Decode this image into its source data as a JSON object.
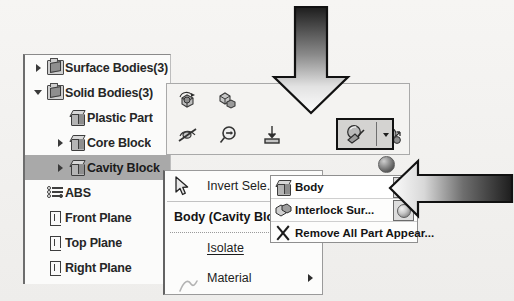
{
  "app": {
    "context": "SolidWorks feature tree with appearance context menu"
  },
  "tree": {
    "name": "feature-manager-tree",
    "items": [
      {
        "label": "Surface Bodies(3)",
        "icon": "folder-surface-icon",
        "expander": "collapsed",
        "indent": 0,
        "selected": false
      },
      {
        "label": "Solid Bodies(3)",
        "icon": "folder-solid-icon",
        "expander": "expanded",
        "indent": 0,
        "selected": false
      },
      {
        "label": "Plastic Part",
        "icon": "solid-body-icon",
        "expander": "none",
        "indent": 1,
        "selected": false
      },
      {
        "label": "Core Block",
        "icon": "solid-body-icon",
        "expander": "collapsed",
        "indent": 1,
        "selected": false
      },
      {
        "label": "Cavity Block",
        "icon": "solid-body-icon",
        "expander": "collapsed",
        "indent": 1,
        "selected": true
      },
      {
        "label": "ABS",
        "icon": "material-icon",
        "expander": "none",
        "indent": 0,
        "selected": false
      },
      {
        "label": "Front Plane",
        "icon": "plane-icon",
        "expander": "none",
        "indent": 0,
        "selected": false
      },
      {
        "label": "Top Plane",
        "icon": "plane-icon",
        "expander": "none",
        "indent": 0,
        "selected": false
      },
      {
        "label": "Right Plane",
        "icon": "plane-icon",
        "expander": "none",
        "indent": 0,
        "selected": false
      }
    ]
  },
  "context_toolbar": {
    "name": "context-toolbar",
    "row1": [
      {
        "icon": "rotate-body-icon",
        "tooltip": ""
      },
      {
        "icon": "move-copy-body-icon",
        "tooltip": ""
      }
    ],
    "row2": [
      {
        "icon": "hide-body-icon",
        "tooltip": ""
      },
      {
        "icon": "zoom-to-selection-icon",
        "tooltip": ""
      },
      {
        "icon": "insert-into-new-part-icon",
        "tooltip": ""
      },
      {
        "icon": "appearances-icon",
        "tooltip": "",
        "selected": true,
        "has_dropdown": true
      },
      {
        "icon": "change-transparency-icon",
        "tooltip": ""
      }
    ]
  },
  "context_menu": {
    "name": "body-context-menu",
    "items": [
      {
        "label": "Invert Sele...",
        "icon": "cursor-arrow-icon",
        "type": "command"
      },
      {
        "label": "Body (Cavity Blo...",
        "icon": "",
        "type": "header"
      },
      {
        "label": "Isolate",
        "icon": "",
        "type": "command",
        "submenu": false
      },
      {
        "label": "Material",
        "icon": "",
        "type": "command",
        "submenu": true
      }
    ]
  },
  "appearance_submenu": {
    "name": "appearances-submenu",
    "items": [
      {
        "label": "Body",
        "icon": "solid-body-icon",
        "swatch": "sphere-appearance-swatch",
        "highlighted": true
      },
      {
        "label": "Interlock Sur...",
        "icon": "surface-body-icon",
        "swatch": "sphere-appearance-swatch",
        "highlighted": false
      },
      {
        "label": "Remove All Part Appear...",
        "icon": "remove-x-icon",
        "swatch": "",
        "highlighted": false
      }
    ]
  },
  "annotations": {
    "arrow_down": {
      "name": "callout-arrow-down",
      "points_to": "appearances-icon"
    },
    "arrow_right": {
      "name": "callout-arrow-left",
      "points_to": "appearances-submenu"
    }
  },
  "colors": {
    "selection": "#a9a9a9",
    "menu_background": "#fcfcfb",
    "panel_background": "#f4f3f1",
    "arrow_dark": "#2b2b2b",
    "border": "#9a9a9a"
  }
}
